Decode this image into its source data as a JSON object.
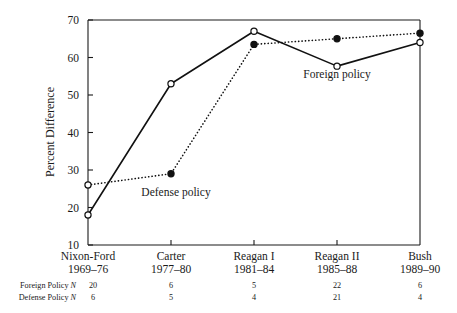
{
  "chart_data": {
    "type": "line",
    "title": "",
    "xlabel": "",
    "ylabel": "Percent Difference",
    "ylim": [
      10,
      70
    ],
    "yticks": [
      10,
      20,
      30,
      40,
      50,
      60,
      70
    ],
    "grid": false,
    "legend_position": "inline-annotations",
    "categories": [
      "Nixon-Ford",
      "Carter",
      "Reagan I",
      "Reagan II",
      "Bush"
    ],
    "category_years": [
      "1969–76",
      "1977–80",
      "1981–84",
      "1985–88",
      "1989–90"
    ],
    "series": [
      {
        "name": "Foreign policy",
        "style": "solid",
        "marker": "open-circle",
        "values": [
          18,
          53,
          67,
          57.7,
          64
        ]
      },
      {
        "name": "Defense policy",
        "style": "dotted",
        "marker": "filled-circle",
        "values": [
          26,
          29,
          63.5,
          65,
          66.5
        ]
      }
    ],
    "annotations": [
      {
        "text": "Foreign policy",
        "series": "Foreign policy"
      },
      {
        "text": "Defense policy",
        "series": "Defense policy"
      }
    ],
    "n_table": {
      "rows": [
        {
          "label": "Foreign Policy",
          "label_symbol": "N",
          "values": [
            "20",
            "6",
            "5",
            "22",
            "6"
          ]
        },
        {
          "label": "Defense Policy",
          "label_symbol": "N",
          "values": [
            "6",
            "5",
            "4",
            "21",
            "4"
          ]
        }
      ]
    },
    "colors": {
      "line": "#111111",
      "axis": "#1a1a1a",
      "background": "#ffffff",
      "marker_fill_open": "#ffffff",
      "marker_fill_closed": "#111111"
    }
  }
}
